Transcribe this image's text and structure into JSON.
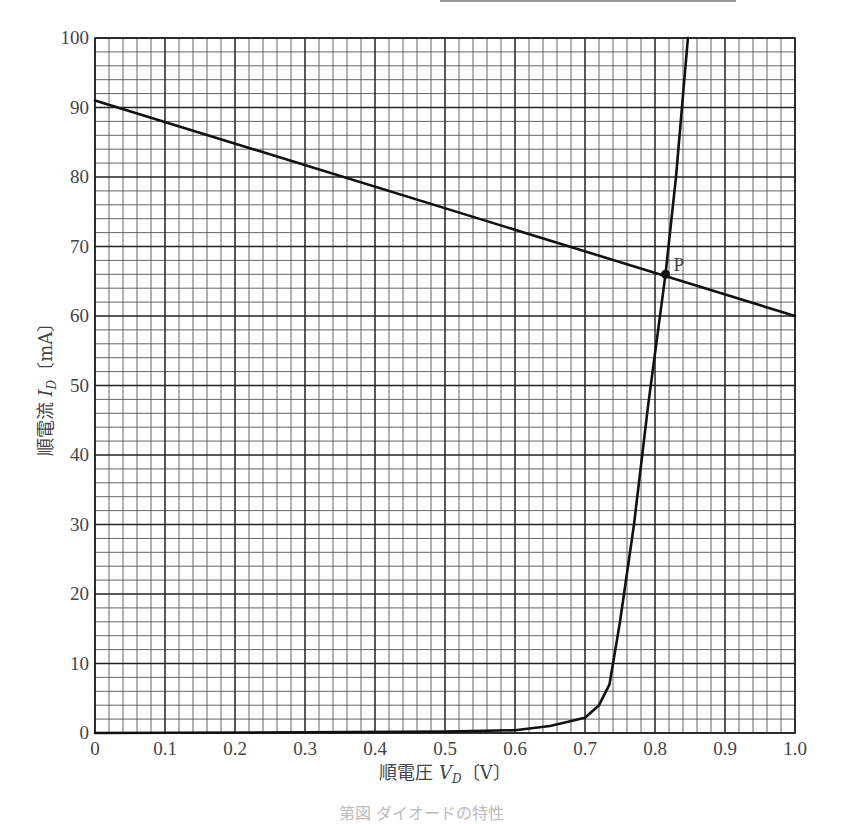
{
  "chart_data": {
    "type": "line",
    "title": "",
    "xlabel": "順電圧 V_D〔V〕",
    "ylabel": "順電流 I_D〔mA〕",
    "xlabel_parts": {
      "prefix": "順電圧 ",
      "var": "V",
      "sub": "D",
      "unit": "〔V〕"
    },
    "ylabel_parts": {
      "prefix": "順電流 ",
      "var": "I",
      "sub": "D",
      "unit": "〔mA〕"
    },
    "xlim": [
      0,
      1.0
    ],
    "ylim": [
      0,
      100
    ],
    "x_ticks": [
      "0",
      "0.1",
      "0.2",
      "0.3",
      "0.4",
      "0.5",
      "0.6",
      "0.7",
      "0.8",
      "0.9",
      "1.0"
    ],
    "y_ticks": [
      "0",
      "10",
      "20",
      "30",
      "40",
      "50",
      "60",
      "70",
      "80",
      "90",
      "100"
    ],
    "grid": {
      "major_x": 0.1,
      "major_y": 10,
      "minor_divisions": 5
    },
    "series": [
      {
        "name": "diode characteristic",
        "x": [
          0,
          0.3,
          0.5,
          0.6,
          0.65,
          0.7,
          0.72,
          0.735,
          0.74,
          0.745,
          0.75,
          0.77,
          0.79,
          0.815,
          0.83,
          0.847
        ],
        "y": [
          0,
          0.1,
          0.2,
          0.4,
          1.0,
          2.2,
          4.0,
          7.0,
          10.0,
          13.0,
          16.0,
          30.0,
          47.0,
          66.0,
          80.0,
          100.0
        ]
      },
      {
        "name": "load line",
        "x": [
          0,
          1.0
        ],
        "y": [
          91,
          60
        ]
      }
    ],
    "annotations": [
      {
        "label": "P",
        "x": 0.815,
        "y": 66,
        "type": "operating-point"
      }
    ]
  },
  "caption": "第図 ダイオードの特性",
  "colors": {
    "line": "#111111",
    "grid": "#333333",
    "text": "#444444"
  }
}
